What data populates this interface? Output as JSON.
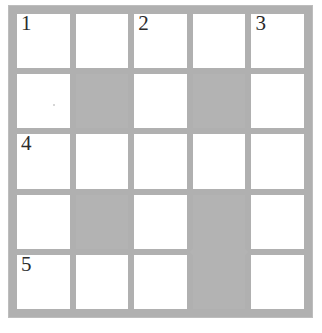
{
  "puzzle": {
    "type": "crossword-grid",
    "rows": 5,
    "columns": 5,
    "colors": {
      "background": "#ffffff",
      "gridline": "#b0b0b0",
      "blocked_cell": "#b3b3b3",
      "open_cell": "#ffffff",
      "number_text": "#2b2b2b"
    },
    "cells": [
      [
        {
          "state": "open",
          "number": "1"
        },
        {
          "state": "open",
          "number": ""
        },
        {
          "state": "open",
          "number": "2"
        },
        {
          "state": "open",
          "number": ""
        },
        {
          "state": "open",
          "number": "3"
        }
      ],
      [
        {
          "state": "open",
          "number": ""
        },
        {
          "state": "blocked",
          "number": ""
        },
        {
          "state": "open",
          "number": ""
        },
        {
          "state": "blocked",
          "number": ""
        },
        {
          "state": "open",
          "number": ""
        }
      ],
      [
        {
          "state": "open",
          "number": "4"
        },
        {
          "state": "open",
          "number": ""
        },
        {
          "state": "open",
          "number": ""
        },
        {
          "state": "open",
          "number": ""
        },
        {
          "state": "open",
          "number": ""
        }
      ],
      [
        {
          "state": "open",
          "number": ""
        },
        {
          "state": "blocked",
          "number": ""
        },
        {
          "state": "open",
          "number": ""
        },
        {
          "state": "blocked",
          "number": ""
        },
        {
          "state": "open",
          "number": ""
        }
      ],
      [
        {
          "state": "open",
          "number": "5"
        },
        {
          "state": "open",
          "number": ""
        },
        {
          "state": "open",
          "number": ""
        },
        {
          "state": "blocked",
          "number": ""
        },
        {
          "state": "open",
          "number": ""
        }
      ]
    ],
    "clue_numbers": [
      "1",
      "2",
      "3",
      "4",
      "5"
    ]
  }
}
